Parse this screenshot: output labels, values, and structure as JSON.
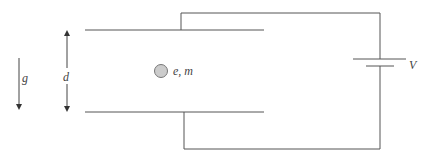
{
  "diagram": {
    "labels": {
      "gravity": "g",
      "separation": "d",
      "particle": "e, m",
      "voltage": "V"
    },
    "colors": {
      "line": "#555555",
      "particle_fill": "#cccccc",
      "particle_stroke": "#777777"
    }
  }
}
